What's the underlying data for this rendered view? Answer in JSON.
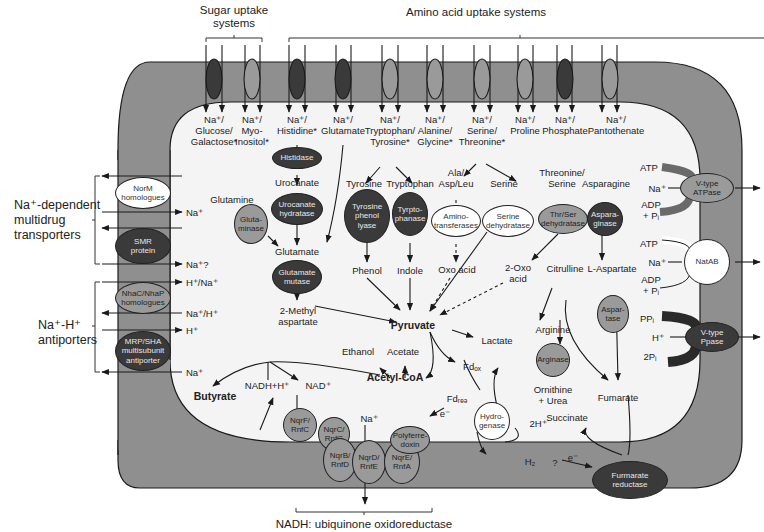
{
  "headers": {
    "sugar_uptake": "Sugar uptake\nsystems",
    "amino_uptake": "Amino acid uptake systems",
    "nadh_oxidoreductase": "NADH: ubiquinone oxidoreductase",
    "multidrug": "Na⁺-dependent\nmultidrug\ntransporters",
    "antiporters": "Na⁺-H⁺\nantiporters"
  },
  "uptake_transporters": [
    {
      "x": 217,
      "shade": "dark",
      "label": "Na⁺/\nGlucose/\nGalactose*"
    },
    {
      "x": 256,
      "shade": "mid",
      "label": "Na⁺/\nMyo-\nInositol*"
    },
    {
      "x": 297,
      "shade": "dark",
      "label": "Na⁺/\nHistidine*"
    },
    {
      "x": 343,
      "shade": "dark",
      "label": "Na⁺/\nGlutamate"
    },
    {
      "x": 389,
      "shade": "mid",
      "label": "Na⁺/\nTryptophan/\nTyrosine*"
    },
    {
      "x": 433,
      "shade": "mid",
      "label": "Na⁺/\nAlanine/\nGlycine*"
    },
    {
      "x": 480,
      "shade": "mid",
      "label": "Na⁺/\nSerine/\nThreonine*"
    },
    {
      "x": 523,
      "shade": "mid",
      "label": "Na⁺/\nProline"
    },
    {
      "x": 562,
      "shade": "dark",
      "label": "Na⁺/\nPhosphate"
    },
    {
      "x": 618,
      "shade": "mid",
      "label": "Na⁺/\nPantothenate"
    }
  ],
  "membrane_left": [
    {
      "name": "NorM\nhomologues",
      "shade": "light",
      "ion": "Na⁺"
    },
    {
      "name": "SMR\nprotein",
      "shade": "dark",
      "ion": "Na⁺?"
    },
    {
      "name": "NhaC/NhaP\nhomologues",
      "shade": "mid",
      "ion_in": "H⁺/Na⁺",
      "ion_out": "Na⁺/H⁺"
    },
    {
      "name": "MRP/SHA\nmultisubunit\nantiporter",
      "shade": "dark",
      "ion_in": "H⁺",
      "ion_out": "Na⁺"
    }
  ],
  "membrane_right": [
    {
      "name": "V-type\nATPase",
      "shade": "mid",
      "atp": "ATP",
      "ion": "Na⁺",
      "adp": "ADP\n+ Pᵢ"
    },
    {
      "name": "NatAB",
      "shade": "light",
      "atp": "ATP",
      "ion": "Na⁺",
      "adp": "ADP\n+ Pᵢ"
    },
    {
      "name": "V-type\nPpase",
      "shade": "dark",
      "ppi": "PPᵢ",
      "ion": "H⁺",
      "pi2": "2Pᵢ"
    }
  ],
  "metabolites": {
    "urocanate": "Urocanate",
    "glutamine": "Glutamine",
    "glutamate": "Glutamate",
    "methyl_aspartate": "2-Methyl\naspartate",
    "tyrosine": "Tyrosine",
    "tryptophan": "Tryptophan",
    "ala_asp_leu": "Ala/\nAsp/Leu",
    "serine": "Serine",
    "threonine_serine": "Threonine/\nSerine",
    "asparagine": "Asparagine",
    "phenol": "Phenol",
    "indole": "Indole",
    "oxo_acid": "Oxo acid",
    "oxo2_acid": "2-Oxo\nacid",
    "citrulline": "Citrulline",
    "l_aspartate": "L-Aspartate",
    "pyruvate": "Pyruvate",
    "lactate": "Lactate",
    "ethanol": "Ethanol",
    "acetate": "Acetate",
    "acetyl_coa": "Acetyl-CoA",
    "butyrate": "Butyrate",
    "nadh_h": "NADH+H⁺",
    "nad": "NAD⁺",
    "fd_ox": "Fdₒₓ",
    "fd_red": "Fdᵣₑₔ",
    "e_minus": "e⁻",
    "na_plus": "Na⁺",
    "arginine": "Arginine",
    "ornithine_urea": "Ornithine\n+ Urea",
    "fumarate": "Fumarate",
    "succinate": "Succinate",
    "two_h": "2H⁺",
    "h2": "H₂",
    "question": "?",
    "e_minus2": "e⁻"
  },
  "enzymes": {
    "histidase": "Histidase",
    "urocanate_hydratase": "Urocanate\nhydratase",
    "glutaminase": "Gluta-\nminase",
    "glutamate_mutase": "Glutamate\nmutase",
    "tyrosine_phenol_lyase": "Tyrosine\nphenol\nlyase",
    "tryptophanase": "Tyrpto-\nphanase",
    "aminotransferases": "Amino-\ntransferases",
    "serine_dehydratase": "Serine\ndehydratase",
    "thr_ser_dehydratase": "Thr/Ser\ndehydratase",
    "asparaginase": "Aspara-\nginase",
    "aspartase": "Aspar-\ntase",
    "arginase": "Arginase",
    "hydrogenase": "Hydro-\ngenase",
    "polyferredoxin": "Polyferre-\ndoxin",
    "nqrf": "NqrF/\nRnfC",
    "nqrc": "NqrC/\nRnfG",
    "nqrb": "NqrB/\nRnfD",
    "nqrd": "NqrD/\nRnfE",
    "nqre": "NqrE/\nRnfA",
    "fumarate_reductase": "Furmarate\nreductase"
  },
  "colors": {
    "membrane": "#8f8f8f",
    "cytoplasm": "#f4f4f4",
    "dark_protein": "#3a3a3a",
    "mid_protein": "#9a9a9a",
    "light_protein": "#ffffff",
    "line": "#1a1a1a"
  }
}
